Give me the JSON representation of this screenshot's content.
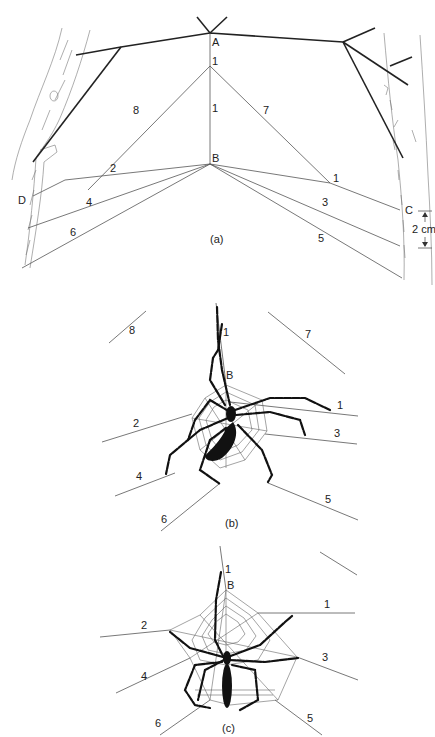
{
  "figure": {
    "panels": [
      {
        "id": "a",
        "caption": "(a)",
        "points": {
          "A": "A",
          "B": "B",
          "C": "C",
          "D": "D"
        },
        "thread_labels": [
          "1",
          "1",
          "8",
          "7",
          "2",
          "1",
          "4",
          "3",
          "6",
          "5"
        ],
        "scale_bar": "2 cm"
      },
      {
        "id": "b",
        "caption": "(b)",
        "points": {
          "B": "B"
        },
        "thread_labels": [
          "8",
          "1",
          "7",
          "1",
          "2",
          "3",
          "4",
          "5",
          "6"
        ]
      },
      {
        "id": "c",
        "caption": "(c)",
        "points": {
          "B": "B"
        },
        "thread_labels": [
          "1",
          "1",
          "2",
          "3",
          "4",
          "5",
          "6"
        ]
      }
    ]
  },
  "colors": {
    "ink": "#222222",
    "background": "#ffffff",
    "bark": "#777777"
  }
}
